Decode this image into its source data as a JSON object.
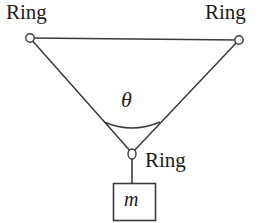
{
  "figure": {
    "type": "free-body-diagram",
    "background_color": "#ffffff",
    "stroke_color": "#3a3a3a",
    "text_color": "#1c1c1c",
    "labels": {
      "ring_left": "Ring",
      "ring_right": "Ring",
      "ring_bottom": "Ring",
      "angle": "θ",
      "mass": "m"
    },
    "geometry": {
      "ring_left": {
        "cx": 30,
        "cy": 38
      },
      "ring_right": {
        "cx": 239,
        "cy": 40
      },
      "ring_bottom": {
        "cx": 132,
        "cy": 154
      },
      "ring_radius": 4.2,
      "top_cable": {
        "x1": 30,
        "y1": 38,
        "x2": 239,
        "y2": 40
      },
      "left_cable": {
        "x1": 30,
        "y1": 38,
        "x2": 132,
        "y2": 154
      },
      "right_cable": {
        "x1": 239,
        "y1": 40,
        "x2": 132,
        "y2": 154
      },
      "hanger": {
        "x1": 132,
        "y1": 158,
        "x2": 132,
        "y2": 183
      },
      "angle_arc": {
        "radius": 45,
        "peak_y": 122
      },
      "mass_box": {
        "x": 113,
        "y": 183,
        "width": 43,
        "height": 38
      }
    }
  }
}
